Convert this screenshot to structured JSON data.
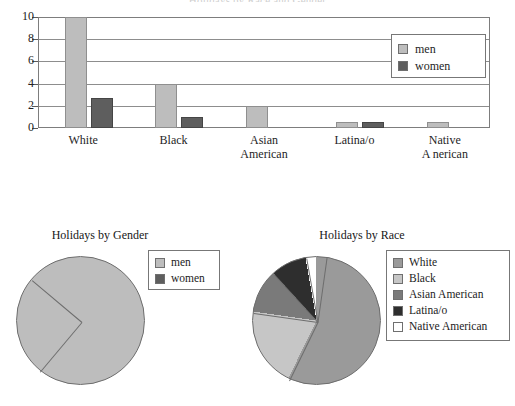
{
  "bar_chart": {
    "title": "Holidays by Race and Gender",
    "legend": {
      "items": [
        {
          "label": "men",
          "color": "#bdbdbd"
        },
        {
          "label": "women",
          "color": "#5e5e5e"
        }
      ]
    },
    "y_ticks": [
      "0",
      "2",
      "4",
      "6",
      "8",
      "10"
    ],
    "categories": [
      "White",
      "Black",
      "Asian American",
      "Latina/o",
      "Native American"
    ],
    "category_lines": [
      [
        "White"
      ],
      [
        "Black"
      ],
      [
        "Asian",
        "American"
      ],
      [
        "Latina/o"
      ],
      [
        "Native",
        "A nerican"
      ]
    ]
  },
  "gender_pie": {
    "title": "Holidays by Gender",
    "legend": {
      "items": [
        {
          "label": "men",
          "color": "#bdbdbd"
        },
        {
          "label": "women",
          "color": "#5e5e5e"
        }
      ]
    }
  },
  "race_pie": {
    "title": "Holidays by Race",
    "legend": {
      "items": [
        {
          "label": "White",
          "color": "#9a9a9a"
        },
        {
          "label": "Black",
          "color": "#c6c6c6"
        },
        {
          "label": "Asian American",
          "color": "#7a7a7a"
        },
        {
          "label": "Latina/o",
          "color": "#2e2e2e"
        },
        {
          "label": "Native American",
          "color": "#ffffff"
        }
      ]
    }
  },
  "chart_data": [
    {
      "type": "bar",
      "title": "Holidays by Race and Gender",
      "xlabel": "",
      "ylabel": "",
      "ylim": [
        0,
        10
      ],
      "yticks": [
        0,
        2,
        4,
        6,
        8,
        10
      ],
      "grid": true,
      "legend_position": "top-right",
      "categories": [
        "White",
        "Black",
        "Asian American",
        "Latina/o",
        "Native American"
      ],
      "series": [
        {
          "name": "men",
          "color": "#bdbdbd",
          "values": [
            10,
            4,
            2,
            0.5,
            0.5
          ]
        },
        {
          "name": "women",
          "color": "#5e5e5e",
          "values": [
            2.7,
            1,
            0,
            0.5,
            0
          ]
        }
      ]
    },
    {
      "type": "pie",
      "title": "Holidays by Gender",
      "legend_position": "right",
      "labels": [
        "men",
        "women"
      ],
      "values": [
        75,
        25
      ],
      "colors": [
        "#bdbdbd",
        "#5e5e5e"
      ],
      "start_angle_deg": 310
    },
    {
      "type": "pie",
      "title": "Holidays by Race",
      "legend_position": "right",
      "labels": [
        "White",
        "Black",
        "Asian American",
        "Latina/o",
        "Native American"
      ],
      "values": [
        55,
        20,
        11,
        9,
        5
      ],
      "colors": [
        "#9a9a9a",
        "#c6c6c6",
        "#7a7a7a",
        "#2e2e2e",
        "#ffffff"
      ],
      "start_angle_deg": 8
    }
  ]
}
